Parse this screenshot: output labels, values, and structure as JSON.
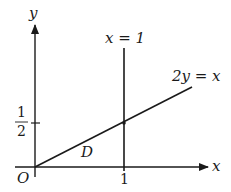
{
  "diagram": {
    "axes": {
      "x_label": "x",
      "y_label": "y",
      "origin_label": "O"
    },
    "ticks": {
      "x_tick": "1",
      "y_tick_numerator": "1",
      "y_tick_denominator": "2"
    },
    "lines": [
      {
        "name": "vertical-line",
        "label": "x = 1"
      },
      {
        "name": "diagonal-line",
        "label": "2y = x"
      }
    ],
    "region_label": "D",
    "colors": {
      "ink": "#1a1a1a",
      "background": "#ffffff"
    }
  }
}
